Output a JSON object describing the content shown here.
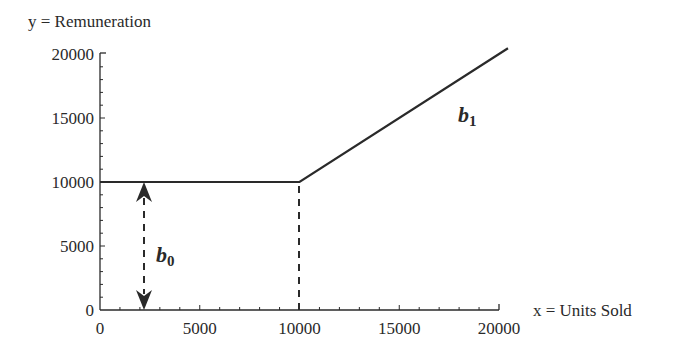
{
  "chart_data": {
    "type": "line",
    "title": "",
    "xlabel": "x = Units Sold",
    "ylabel": "y = Remuneration",
    "xlim": [
      0,
      20000
    ],
    "ylim": [
      0,
      20000
    ],
    "x_ticks": [
      "0",
      "5000",
      "10000",
      "15000",
      "20000"
    ],
    "y_ticks": [
      "0",
      "5000",
      "10000",
      "15000",
      "20000"
    ],
    "grid": false,
    "legend": null,
    "series": [
      {
        "name": "Remuneration",
        "x": [
          0,
          10000,
          20000
        ],
        "y": [
          10000,
          10000,
          20000
        ],
        "note": "piecewise linear: flat at 10000 until 10000 units, then slope ≈ 1 (line extends slightly beyond 20000 units)"
      }
    ],
    "annotations": [
      {
        "text": "b",
        "subscript": "0",
        "meaning": "intercept; double-headed dashed arrow from y=0 to y=10000 at x≈2300"
      },
      {
        "text": "b",
        "subscript": "1",
        "meaning": "slope of the rising segment"
      },
      {
        "type": "dashed-vertical",
        "x": 10000,
        "from_y": 0,
        "to_y": 10000
      }
    ]
  },
  "labels": {
    "ylabel": "y = Remuneration",
    "xlabel": "x = Units Sold",
    "b0_main": "b",
    "b0_sub": "0",
    "b1_main": "b",
    "b1_sub": "1"
  }
}
